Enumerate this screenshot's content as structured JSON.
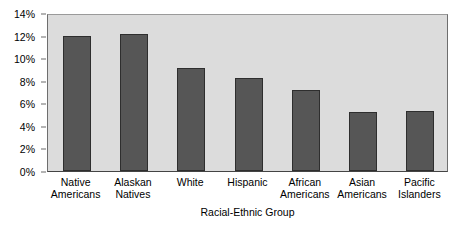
{
  "chart_data": {
    "type": "bar",
    "title": "",
    "xlabel": "Racial-Ethnic Group",
    "ylabel": "",
    "categories": [
      "Native Americans",
      "Alaskan Natives",
      "White",
      "Hispanic",
      "African Americans",
      "Asian Americans",
      "Pacific Islanders"
    ],
    "category_lines": [
      [
        "Native",
        "Americans"
      ],
      [
        "Alaskan",
        "Natives"
      ],
      [
        "White",
        ""
      ],
      [
        "Hispanic",
        ""
      ],
      [
        "African",
        "Americans"
      ],
      [
        "Asian",
        "Americans"
      ],
      [
        "Pacific",
        "Islanders"
      ]
    ],
    "values": [
      12.0,
      12.1,
      9.1,
      8.2,
      7.2,
      5.2,
      5.3
    ],
    "value_unit": "%",
    "ylim": [
      0,
      14
    ],
    "ytick_values": [
      0,
      2,
      4,
      6,
      8,
      10,
      12,
      14
    ],
    "ytick_labels": [
      "0%",
      "2%",
      "4%",
      "6%",
      "8%",
      "10%",
      "12%",
      "14%"
    ],
    "grid": false,
    "legend": null,
    "bar_color": "#565656",
    "bar_border_color": "#2e2e2e",
    "plot_background": "#dcdcdc",
    "page_background": "#ffffff",
    "axis_color": "#444444"
  }
}
